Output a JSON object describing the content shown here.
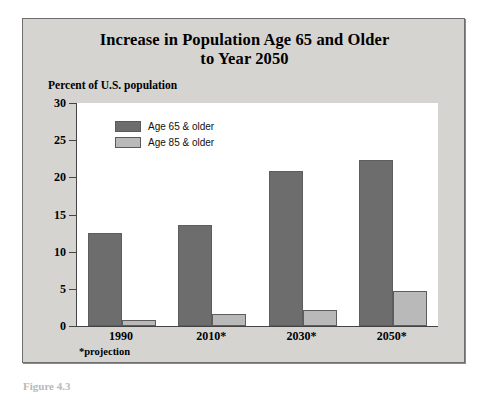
{
  "figure": {
    "caption": "Figure 4.3"
  },
  "chart_data": {
    "type": "bar",
    "title": "Increase in Population Age 65 and Older to Year 2050",
    "title_lines": [
      "Increase in Population Age 65 and Older",
      "to Year 2050"
    ],
    "subtitle": "",
    "xlabel": "",
    "ylabel": "Percent of U.S. population",
    "categories": [
      "1990",
      "2010*",
      "2030*",
      "2050*"
    ],
    "series": [
      {
        "name": "Age 65 & older",
        "color": "#6d6d6d",
        "values": [
          12.5,
          13.6,
          20.9,
          22.3
        ]
      },
      {
        "name": "Age 85 & older",
        "color": "#b9b9b9",
        "values": [
          0.8,
          1.6,
          2.1,
          4.7
        ]
      }
    ],
    "ylim": [
      0,
      30
    ],
    "yticks": [
      0,
      5,
      10,
      15,
      20,
      25,
      30
    ],
    "ytick_labels": [
      "0",
      "5",
      "10",
      "15",
      "20",
      "25",
      "30"
    ],
    "grid": false,
    "legend_position": "top-left-inside",
    "footnote": "*projection",
    "plot_background": "#ffffff",
    "panel_background": "#d5d4d1",
    "axis_color": "#444444"
  }
}
